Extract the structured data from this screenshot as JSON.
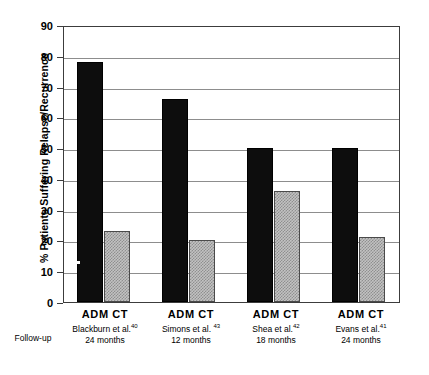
{
  "chart_data": {
    "type": "bar",
    "title": "",
    "xlabel": "Follow-up",
    "ylabel": "% Patients Suffering Relapse/Recurrence",
    "ylim": [
      0,
      90
    ],
    "ytick_step": 10,
    "yticks": [
      90,
      80,
      70,
      60,
      50,
      40,
      30,
      20,
      10,
      0
    ],
    "grid": true,
    "legend_position": "none",
    "categories": [
      "Blackburn et al.40 24 months",
      "Simons et al. 43 12 months",
      "Shea et al.42 18 months",
      "Evans et al.41 24 months"
    ],
    "series": [
      {
        "name": "ADM",
        "color": "#0d0d0d",
        "values": [
          78,
          66,
          50,
          50
        ]
      },
      {
        "name": "CT",
        "color": "#c2c2c2",
        "values": [
          23,
          20,
          36,
          21
        ]
      }
    ]
  },
  "axis": {
    "y_title": "% Patients Suffering Relapse/Recurrence",
    "tick_labels": [
      "90",
      "80",
      "70",
      "60",
      "50",
      "40",
      "30",
      "20",
      "10",
      "0"
    ]
  },
  "xaxis": {
    "followup_label": "Follow-up",
    "series_labels": {
      "adm": "ADM",
      "ct": "CT"
    },
    "groups": [
      {
        "series": "ADM  CT",
        "study": "Blackburn et al.",
        "ref": "40",
        "period": "24 months"
      },
      {
        "series": "ADM  CT",
        "study": "Simons et al. ",
        "ref": "43",
        "period": "12 months"
      },
      {
        "series": "ADM  CT",
        "study": "Shea et al.",
        "ref": "42",
        "period": "18 months"
      },
      {
        "series": "ADM  CT",
        "study": "Evans et al.",
        "ref": "41",
        "period": "24 months"
      }
    ]
  },
  "colors": {
    "adm_bar": "#0d0d0d",
    "ct_bar": "#c2c2c2",
    "gridline": "#8d8d8d",
    "frame": "#3c3c3c",
    "background": "#ffffff"
  }
}
